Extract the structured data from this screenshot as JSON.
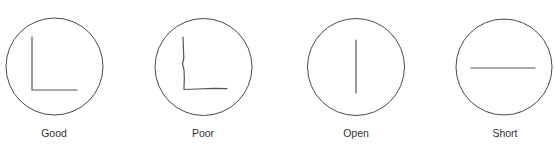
{
  "diagram": {
    "type": "weld-trace-quality-examples",
    "panels": [
      {
        "id": "good",
        "label": "Good",
        "shape": "L-corner",
        "description": "Clean right-angle L trace"
      },
      {
        "id": "poor",
        "label": "Poor",
        "shape": "wobbly-L-corner",
        "description": "Irregular L trace with wavy vertical"
      },
      {
        "id": "open",
        "label": "Open",
        "shape": "vertical-line",
        "description": "Single vertical line"
      },
      {
        "id": "short",
        "label": "Short",
        "shape": "horizontal-line",
        "description": "Single horizontal line"
      }
    ],
    "colors": {
      "outline": "#4a4a4a",
      "trace": "#555555",
      "text": "#333333",
      "background": "#ffffff"
    }
  }
}
